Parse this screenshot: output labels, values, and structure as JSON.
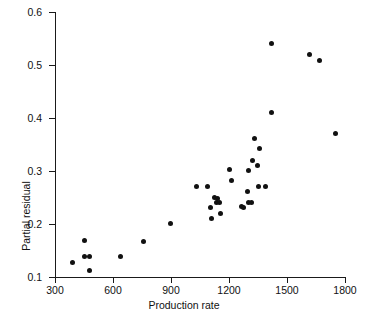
{
  "chart_data": {
    "type": "scatter",
    "title": "",
    "xlabel": "Production rate",
    "ylabel": "Partial residual",
    "xlim": [
      300,
      1800
    ],
    "ylim": [
      0.1,
      0.6
    ],
    "xticks": [
      300,
      600,
      900,
      1200,
      1500,
      1800
    ],
    "yticks": [
      "0.1",
      "0.2",
      "0.3",
      "0.4",
      "0.5",
      "0.6"
    ],
    "grid": false,
    "legend": null,
    "marker": "filled-circle",
    "marker_color": "#111111",
    "points": [
      {
        "x": 390,
        "y": 0.127
      },
      {
        "x": 450,
        "y": 0.168
      },
      {
        "x": 450,
        "y": 0.138
      },
      {
        "x": 480,
        "y": 0.138
      },
      {
        "x": 480,
        "y": 0.113
      },
      {
        "x": 640,
        "y": 0.138
      },
      {
        "x": 760,
        "y": 0.167
      },
      {
        "x": 895,
        "y": 0.201
      },
      {
        "x": 1030,
        "y": 0.27
      },
      {
        "x": 1090,
        "y": 0.27
      },
      {
        "x": 1105,
        "y": 0.231
      },
      {
        "x": 1110,
        "y": 0.21
      },
      {
        "x": 1125,
        "y": 0.25
      },
      {
        "x": 1140,
        "y": 0.248
      },
      {
        "x": 1135,
        "y": 0.241
      },
      {
        "x": 1150,
        "y": 0.24
      },
      {
        "x": 1155,
        "y": 0.219
      },
      {
        "x": 1200,
        "y": 0.302
      },
      {
        "x": 1215,
        "y": 0.282
      },
      {
        "x": 1265,
        "y": 0.233
      },
      {
        "x": 1275,
        "y": 0.232
      },
      {
        "x": 1295,
        "y": 0.262
      },
      {
        "x": 1300,
        "y": 0.241
      },
      {
        "x": 1315,
        "y": 0.241
      },
      {
        "x": 1300,
        "y": 0.301
      },
      {
        "x": 1320,
        "y": 0.32
      },
      {
        "x": 1330,
        "y": 0.361
      },
      {
        "x": 1345,
        "y": 0.31
      },
      {
        "x": 1350,
        "y": 0.27
      },
      {
        "x": 1390,
        "y": 0.27
      },
      {
        "x": 1360,
        "y": 0.343
      },
      {
        "x": 1420,
        "y": 0.41
      },
      {
        "x": 1420,
        "y": 0.54
      },
      {
        "x": 1615,
        "y": 0.52
      },
      {
        "x": 1670,
        "y": 0.509
      },
      {
        "x": 1750,
        "y": 0.37
      }
    ]
  },
  "axis": {
    "x_title": "Production rate",
    "y_title": "Partial residual"
  }
}
